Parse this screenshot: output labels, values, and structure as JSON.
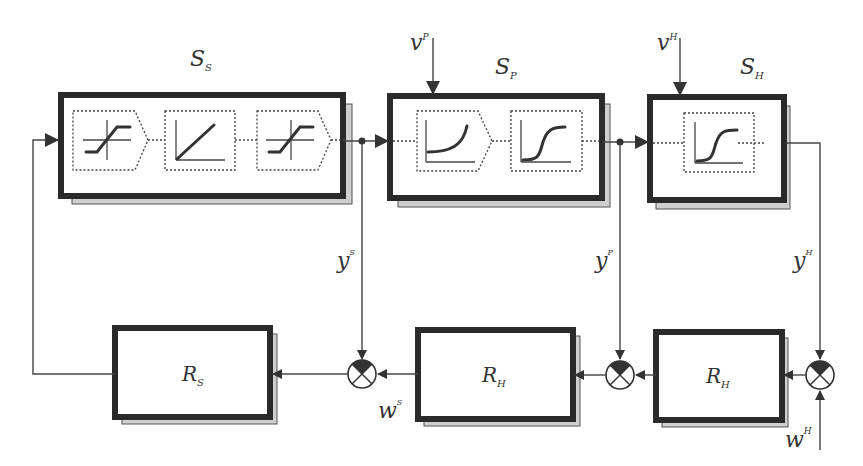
{
  "diagram": {
    "plants": [
      {
        "id": "S_S",
        "label": "S",
        "sub": "S",
        "blocks": [
          "saturation",
          "linear",
          "saturation"
        ]
      },
      {
        "id": "S_P",
        "label": "S",
        "sub": "P",
        "blocks": [
          "exponential",
          "sigmoid"
        ]
      },
      {
        "id": "S_H",
        "label": "S",
        "sub": "H",
        "blocks": [
          "sigmoid"
        ]
      }
    ],
    "controllers": [
      {
        "id": "R_S",
        "label": "R",
        "sub": "S"
      },
      {
        "id": "R_H_mid",
        "label": "R",
        "sub": "H"
      },
      {
        "id": "R_H_right",
        "label": "R",
        "sub": "H"
      }
    ],
    "disturbances": [
      {
        "id": "v_P",
        "label": "v",
        "sup": "P"
      },
      {
        "id": "v_H",
        "label": "v",
        "sup": "H"
      }
    ],
    "outputs": [
      {
        "id": "y_S",
        "label": "y",
        "sup": "S"
      },
      {
        "id": "y_P",
        "label": "y",
        "sup": "P"
      },
      {
        "id": "y_H",
        "label": "y",
        "sup": "H"
      }
    ],
    "setpoints": [
      {
        "id": "w_S",
        "label": "w",
        "sup": "S"
      },
      {
        "id": "w_H",
        "label": "w",
        "sup": "H"
      }
    ],
    "colors": {
      "stroke": "#2a2a2a",
      "shadow": "#cfcfcf",
      "background": "#ffffff"
    }
  }
}
